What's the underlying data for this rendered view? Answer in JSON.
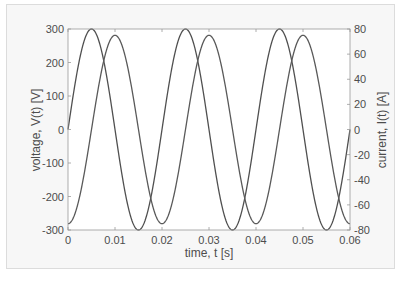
{
  "chart_data": {
    "type": "line",
    "title": "",
    "xlabel": "time, t [s]",
    "ylabel_left": "voltage, V(t) [V]",
    "ylabel_right": "current, I(t) [A]",
    "xlim": [
      0,
      0.06
    ],
    "ylim_left": [
      -300,
      300
    ],
    "ylim_right": [
      -80,
      80
    ],
    "x_ticks": [
      0,
      0.01,
      0.02,
      0.03,
      0.04,
      0.05,
      0.06
    ],
    "x_tick_labels": [
      "0",
      "0.01",
      "0.02",
      "0.03",
      "0.04",
      "0.05",
      "0.06"
    ],
    "y_left_ticks": [
      -300,
      -200,
      -100,
      0,
      100,
      200,
      300
    ],
    "y_left_tick_labels": [
      "-300",
      "-200",
      "-100",
      "0",
      "100",
      "200",
      "300"
    ],
    "y_right_ticks": [
      -80,
      -60,
      -40,
      -20,
      0,
      20,
      40,
      60,
      80
    ],
    "y_right_tick_labels": [
      "-80",
      "-60",
      "-40",
      "-20",
      "0",
      "20",
      "40",
      "60",
      "80"
    ],
    "grid": false,
    "legend": null,
    "series": [
      {
        "name": "V(t)",
        "axis": "left",
        "function": "300*sin(2*pi*50*t)",
        "amplitude": 300,
        "frequency_hz": 50,
        "phase_rad": 0,
        "color": "#505050",
        "x": [
          0,
          0.0025,
          0.005,
          0.0075,
          0.01,
          0.0125,
          0.015,
          0.0175,
          0.02,
          0.0225,
          0.025,
          0.0275,
          0.03,
          0.0325,
          0.035,
          0.0375,
          0.04,
          0.0425,
          0.045,
          0.0475,
          0.05,
          0.0525,
          0.055,
          0.0575,
          0.06
        ],
        "values": [
          0,
          212,
          300,
          212,
          0,
          -212,
          -300,
          -212,
          0,
          212,
          300,
          212,
          0,
          -212,
          -300,
          -212,
          0,
          212,
          300,
          212,
          0,
          -212,
          -300,
          -212,
          0
        ]
      },
      {
        "name": "I(t)",
        "axis": "right",
        "function": "75*sin(2*pi*50*t - pi/2)",
        "amplitude": 75,
        "frequency_hz": 50,
        "phase_rad": -1.5708,
        "color": "#5a5a5a",
        "x": [
          0,
          0.0025,
          0.005,
          0.0075,
          0.01,
          0.0125,
          0.015,
          0.0175,
          0.02,
          0.0225,
          0.025,
          0.0275,
          0.03,
          0.0325,
          0.035,
          0.0375,
          0.04,
          0.0425,
          0.045,
          0.0475,
          0.05,
          0.0525,
          0.055,
          0.0575,
          0.06
        ],
        "values": [
          -75,
          -53,
          0,
          53,
          75,
          53,
          0,
          -53,
          -75,
          -53,
          0,
          53,
          75,
          53,
          0,
          -53,
          -75,
          -53,
          0,
          53,
          75,
          53,
          0,
          -53,
          -75
        ]
      }
    ]
  },
  "style": {
    "axis_color": "#9a9a9a",
    "text_color": "#4d4d4d",
    "frame_bg": "#f7f7f7",
    "plot_bg": "#ffffff"
  }
}
